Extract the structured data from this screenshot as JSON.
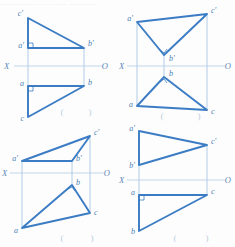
{
  "page": {
    "header_text": "……………… ………… …………",
    "colors": {
      "heavy_line": "#3b7cc4",
      "thin_line": "#8fb8dc",
      "axis_line": "#a9c4de",
      "label_text": "#4a7fb5",
      "paren_text": "#b9cde2",
      "background": "#fdfdfd"
    },
    "stroke_widths": {
      "heavy": 1.9,
      "thin": 0.7,
      "axis": 0.7
    }
  },
  "figures": [
    {
      "id": "quad-1",
      "position": "top-left",
      "caption_left": "(",
      "caption_right": ")",
      "axis": {
        "label_left": "X",
        "label_right": "O",
        "y": 66
      },
      "points_upper": [
        {
          "name": "c-prime",
          "label": "c'",
          "x": 28,
          "y": 18
        },
        {
          "name": "a-prime",
          "label": "a'",
          "x": 28,
          "y": 48
        },
        {
          "name": "b-prime",
          "label": "b'",
          "x": 84,
          "y": 48
        }
      ],
      "points_lower": [
        {
          "name": "a",
          "label": "a",
          "x": 28,
          "y": 86
        },
        {
          "name": "b",
          "label": "b",
          "x": 84,
          "y": 86
        },
        {
          "name": "c",
          "label": "c",
          "x": 28,
          "y": 117
        }
      ],
      "right_angle_markers": [
        "a-prime",
        "a"
      ]
    },
    {
      "id": "quad-2",
      "position": "top-right",
      "caption_left": "(",
      "caption_right": ")",
      "axis": {
        "label_left": "X",
        "label_right": "O",
        "y": 66
      },
      "points_upper": [
        {
          "name": "a-prime",
          "label": "a'",
          "x": 20,
          "y": 22
        },
        {
          "name": "c-prime",
          "label": "c'",
          "x": 90,
          "y": 14
        },
        {
          "name": "b-prime",
          "label": "b'",
          "x": 47,
          "y": 55
        }
      ],
      "points_lower": [
        {
          "name": "b",
          "label": "b",
          "x": 47,
          "y": 77
        },
        {
          "name": "a",
          "label": "a",
          "x": 20,
          "y": 106
        },
        {
          "name": "c",
          "label": "c",
          "x": 90,
          "y": 110
        }
      ],
      "right_angle_markers": [
        "b-prime",
        "b"
      ]
    },
    {
      "id": "quad-3",
      "position": "bottom-left",
      "caption_left": "(",
      "caption_right": ")",
      "axis": {
        "label_left": "X",
        "label_right": "O",
        "y": 50
      },
      "points_upper": [
        {
          "name": "c-prime",
          "label": "c'",
          "x": 90,
          "y": 13
        },
        {
          "name": "a-prime",
          "label": "a'",
          "x": 22,
          "y": 38
        },
        {
          "name": "b-prime",
          "label": "b'",
          "x": 72,
          "y": 38
        }
      ],
      "points_lower": [
        {
          "name": "b",
          "label": "b",
          "x": 72,
          "y": 62
        },
        {
          "name": "c",
          "label": "c",
          "x": 90,
          "y": 90
        },
        {
          "name": "a",
          "label": "a",
          "x": 22,
          "y": 105
        }
      ],
      "right_angle_markers": [
        "b"
      ]
    },
    {
      "id": "quad-4",
      "position": "bottom-right",
      "caption_left": "(",
      "caption_right": ")",
      "axis": {
        "label_left": "X",
        "label_right": "O",
        "y": 57
      },
      "points_upper": [
        {
          "name": "a-prime",
          "label": "a'",
          "x": 22,
          "y": 8
        },
        {
          "name": "c-prime",
          "label": "c'",
          "x": 90,
          "y": 22
        },
        {
          "name": "b-prime",
          "label": "b'",
          "x": 22,
          "y": 42
        }
      ],
      "points_lower": [
        {
          "name": "a",
          "label": "a",
          "x": 22,
          "y": 72
        },
        {
          "name": "c",
          "label": "c",
          "x": 90,
          "y": 72
        },
        {
          "name": "b",
          "label": "b",
          "x": 22,
          "y": 108
        }
      ],
      "right_angle_markers": [
        "a"
      ]
    }
  ]
}
